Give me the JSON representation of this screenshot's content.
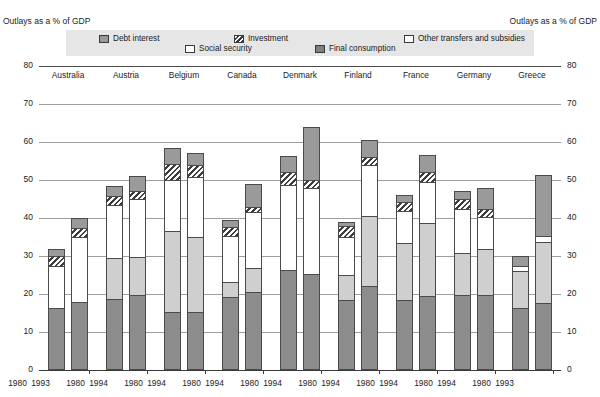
{
  "captions": {
    "left": "Outlays as a % of GDP",
    "right": "Outlays as a % of GDP"
  },
  "legend": {
    "debt_interest": "Debt interest",
    "social_security": "Social security",
    "investment": "Investment",
    "final_consumption": "Final consumption",
    "other_transfers": "Other transfers and subsidies"
  },
  "chart_data": {
    "type": "bar",
    "title": "",
    "xlabel": "",
    "ylabel": "Outlays as a % of GDP",
    "ylim": [
      0,
      80
    ],
    "yticks": [
      0,
      10,
      20,
      30,
      40,
      50,
      60,
      70,
      80
    ],
    "grid": true,
    "stacked": true,
    "legend_position": "top",
    "countries": [
      "Australia",
      "Austria",
      "Belgium",
      "Canada",
      "Denmark",
      "Finland",
      "France",
      "Germany",
      "Greece"
    ],
    "categories": [
      "1980",
      "1993",
      "1980",
      "1994",
      "1980",
      "1994",
      "1980",
      "1994",
      "1980",
      "1994",
      "1980",
      "1994",
      "1980",
      "1994",
      "1980",
      "1994",
      "1980",
      "1993"
    ],
    "series": [
      {
        "name": "Final consumption",
        "color": "#8c8c8c",
        "values": [
          16.4,
          18.0,
          18.6,
          19.8,
          15.2,
          15.2,
          19.1,
          20.4,
          26.2,
          25.3,
          18.3,
          22.1,
          18.4,
          19.6,
          19.8,
          19.7,
          16.4,
          17.6
        ]
      },
      {
        "name": "Social security",
        "color": "#cfcfcf",
        "values": [
          0.0,
          0.0,
          10.8,
          9.9,
          21.3,
          19.9,
          4.0,
          6.5,
          0.0,
          0.0,
          6.7,
          18.5,
          15.0,
          19.0,
          11.1,
          12.1,
          9.6,
          16.1
        ]
      },
      {
        "name": "Other transfers and subsidies",
        "color": "#ffffff",
        "values": [
          11.0,
          17.1,
          14.0,
          15.3,
          13.6,
          15.6,
          12.1,
          14.7,
          22.6,
          22.6,
          10.1,
          13.3,
          8.4,
          11.0,
          11.4,
          8.4,
          1.4,
          1.5
        ]
      },
      {
        "name": "Investment",
        "color": "#hatch",
        "values": [
          2.6,
          2.3,
          2.5,
          2.0,
          4.1,
          3.2,
          2.5,
          1.2,
          3.3,
          2.1,
          2.9,
          2.1,
          2.5,
          2.5,
          2.8,
          2.3,
          0.0,
          0.0
        ]
      },
      {
        "name": "Debt interest",
        "color": "#9a9a9a",
        "values": [
          1.8,
          2.6,
          2.6,
          4.0,
          4.3,
          3.2,
          1.8,
          6.2,
          4.2,
          14.0,
          1.0,
          4.5,
          1.7,
          4.4,
          1.9,
          5.5,
          2.6,
          16.1
        ]
      }
    ],
    "totals": [
      31.8,
      40.0,
      48.5,
      51.0,
      58.5,
      57.1,
      39.5,
      49.0,
      56.3,
      64.0,
      39.0,
      60.5,
      46.0,
      56.5,
      47.0,
      48.0,
      30.0,
      51.3
    ]
  }
}
